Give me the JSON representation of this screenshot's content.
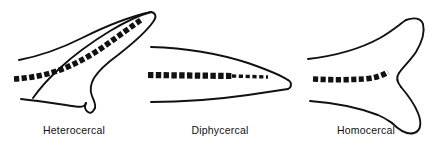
{
  "figure": {
    "background_color": "#ffffff",
    "ink_color": "#111111",
    "panels": [
      {
        "id": "heterocercal",
        "label": "Heterocercal",
        "description": "Asymmetrical tail with an elongated upper lobe; the vertebral column bends upward into the dorsal lobe.",
        "vertebral_column": "dashed, curving upward toward the tip of the upper lobe"
      },
      {
        "id": "diphycercal",
        "label": "Diphycercal",
        "description": "Symmetrical pointed tail; the vertebral column runs straight to the tip.",
        "vertebral_column": "dashed, straight and horizontal, tapering toward the tip"
      },
      {
        "id": "homocercal",
        "label": "Homocercal",
        "description": "Externally symmetrical forked tail; the vertebral column turns slightly upward at the base of the fin.",
        "vertebral_column": "dashed, slightly upturned at the posterior end"
      }
    ]
  }
}
